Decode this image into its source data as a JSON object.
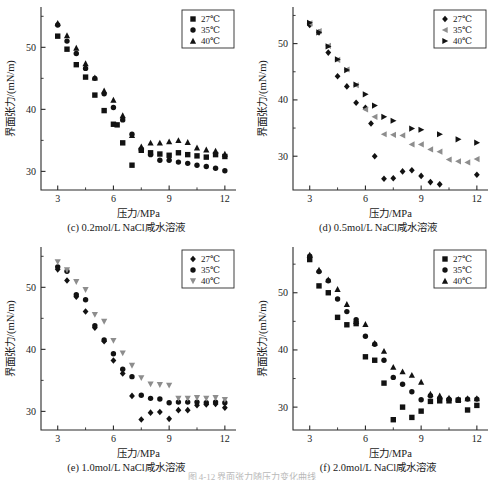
{
  "figure": {
    "caption_clipped": "图 4-12  界面张力随压力变化曲线",
    "panels_order": [
      "c",
      "d",
      "e",
      "f"
    ]
  },
  "axes": {
    "xlabel": "压力/MPa",
    "ylabel": "界面张力/(mN/m)",
    "xlim": [
      2.1,
      12.6
    ],
    "ylim": [
      27.0,
      56.5
    ],
    "xticks_major": [
      3,
      6,
      9,
      12
    ],
    "xticks_minor": [
      4.5,
      7.5,
      10.5
    ],
    "yticks_major": [
      30,
      40,
      50
    ],
    "yticks_minor": [
      35,
      45,
      55
    ],
    "xtick_labels": [
      "3",
      "6",
      "9",
      "12"
    ],
    "ytick_labels": [
      "30",
      "40",
      "50"
    ],
    "grid": false,
    "legend_position": "top-right"
  },
  "legend_labels": {
    "t27": "27℃",
    "t35": "35℃",
    "t40": "40℃"
  },
  "colors": {
    "ink": "#1a1a1a",
    "axis": "#2b2b2b",
    "marker_dark": "#121212",
    "marker_gray": "#8d8d8d",
    "caption_faint": "#b9b9b9"
  },
  "chart_data": [
    {
      "id": "c",
      "type": "scatter",
      "title": "(c)  0.2mol/L NaCl咸水溶液",
      "xlabel": "压力/MPa",
      "ylabel": "界面张力/(mN/m)",
      "xlim": [
        2.1,
        12.6
      ],
      "ylim": [
        27.0,
        56.5
      ],
      "grid": false,
      "series": [
        {
          "name": "27℃",
          "marker": "square",
          "color": "#121212",
          "x": [
            3.0,
            3.5,
            4.0,
            4.5,
            5.0,
            5.5,
            6.0,
            6.2,
            6.5,
            7.0,
            7.5,
            8.0,
            8.5,
            9.0,
            9.5,
            10.0,
            10.5,
            11.0,
            11.5,
            12.0
          ],
          "y": [
            51.8,
            49.7,
            47.2,
            45.2,
            42.3,
            39.8,
            37.6,
            37.5,
            34.6,
            31.0,
            33.4,
            33.0,
            32.8,
            32.6,
            33.0,
            32.7,
            32.5,
            32.3,
            32.7,
            32.4
          ]
        },
        {
          "name": "35℃",
          "marker": "circle",
          "color": "#121212",
          "x": [
            3.0,
            3.5,
            4.0,
            4.5,
            5.0,
            5.5,
            6.0,
            6.5,
            7.0,
            7.5,
            8.0,
            8.5,
            9.0,
            9.5,
            10.0,
            10.5,
            11.0,
            11.5,
            12.0
          ],
          "y": [
            53.6,
            51.0,
            49.0,
            46.6,
            45.0,
            42.5,
            40.3,
            38.3,
            36.0,
            33.5,
            32.7,
            31.8,
            31.8,
            31.5,
            31.3,
            31.0,
            30.8,
            30.5,
            30.1
          ]
        },
        {
          "name": "40℃",
          "marker": "triangle-up",
          "color": "#121212",
          "x": [
            3.0,
            3.5,
            4.0,
            4.5,
            5.0,
            5.5,
            6.0,
            6.5,
            7.0,
            7.5,
            8.0,
            8.5,
            9.0,
            9.5,
            10.0,
            10.5,
            11.0,
            11.5,
            12.0
          ],
          "y": [
            53.9,
            51.9,
            49.9,
            47.4,
            45.1,
            43.0,
            41.5,
            39.0,
            35.8,
            34.0,
            34.6,
            34.6,
            34.8,
            35.0,
            34.7,
            33.8,
            33.5,
            33.3,
            32.8
          ]
        }
      ]
    },
    {
      "id": "d",
      "type": "scatter",
      "title": "(d)  0.5mol/L NaCl咸水溶液",
      "xlabel": "压力/MPa",
      "ylabel": "界面张力/(mN/m)",
      "xlim": [
        2.1,
        12.6
      ],
      "ylim": [
        24.0,
        56.5
      ],
      "grid": false,
      "series": [
        {
          "name": "27℃",
          "marker": "diamond",
          "color": "#121212",
          "x": [
            3.0,
            3.5,
            4.0,
            4.5,
            5.0,
            5.5,
            6.0,
            6.3,
            6.5,
            7.0,
            7.5,
            8.0,
            8.5,
            9.0,
            9.5,
            10.0,
            12.0
          ],
          "y": [
            53.3,
            52.0,
            48.4,
            44.2,
            42.4,
            39.5,
            38.6,
            35.8,
            30.0,
            26.0,
            26.1,
            27.3,
            27.5,
            26.5,
            25.4,
            25.0,
            26.7
          ]
        },
        {
          "name": "35℃",
          "marker": "triangle-left",
          "color": "#8d8d8d",
          "x": [
            3.0,
            3.5,
            4.0,
            4.5,
            5.0,
            5.5,
            6.0,
            6.5,
            7.0,
            7.5,
            8.0,
            8.5,
            9.0,
            9.5,
            10.0,
            10.5,
            11.0,
            11.5,
            12.0
          ],
          "y": [
            53.6,
            52.2,
            49.6,
            47.1,
            45.4,
            42.6,
            38.3,
            37.0,
            33.9,
            33.8,
            33.7,
            32.1,
            32.1,
            31.2,
            30.8,
            29.4,
            29.1,
            28.9,
            29.5
          ]
        },
        {
          "name": "40℃",
          "marker": "triangle-right",
          "color": "#121212",
          "x": [
            3.0,
            3.5,
            4.0,
            4.5,
            5.0,
            5.5,
            6.0,
            6.5,
            7.0,
            7.5,
            8.5,
            9.0,
            10.0,
            11.0,
            12.0
          ],
          "y": [
            53.7,
            52.0,
            49.5,
            47.2,
            45.3,
            42.7,
            41.0,
            39.0,
            37.0,
            36.3,
            34.9,
            34.7,
            33.9,
            33.0,
            32.4
          ]
        }
      ]
    },
    {
      "id": "e",
      "type": "scatter",
      "title": "(e)  1.0mol/L NaCl咸水溶液",
      "xlabel": "压力/MPa",
      "ylabel": "界面张力/(mN/m)",
      "xlim": [
        2.1,
        12.6
      ],
      "ylim": [
        27.0,
        56.5
      ],
      "grid": false,
      "series": [
        {
          "name": "27℃",
          "marker": "diamond",
          "color": "#121212",
          "x": [
            3.0,
            3.5,
            4.0,
            4.5,
            5.0,
            5.5,
            6.0,
            6.5,
            7.0,
            7.5,
            8.0,
            8.5,
            9.0,
            9.5,
            10.0,
            10.5,
            11.0,
            11.5,
            12.0
          ],
          "y": [
            52.9,
            51.1,
            48.5,
            46.1,
            43.5,
            41.3,
            38.2,
            36.1,
            32.5,
            28.7,
            29.8,
            29.9,
            28.8,
            30.2,
            30.2,
            31.0,
            31.1,
            31.2,
            30.6
          ]
        },
        {
          "name": "35℃",
          "marker": "circle",
          "color": "#121212",
          "x": [
            3.0,
            3.5,
            4.0,
            4.5,
            5.0,
            5.5,
            6.0,
            6.5,
            7.0,
            7.5,
            8.0,
            8.5,
            9.0,
            9.5,
            10.0,
            10.5,
            11.0,
            11.5,
            12.0
          ],
          "y": [
            53.3,
            52.6,
            48.8,
            48.0,
            43.8,
            41.5,
            39.3,
            36.8,
            35.6,
            32.6,
            32.1,
            32.0,
            31.4,
            31.5,
            31.5,
            31.5,
            31.4,
            31.5,
            31.4
          ]
        },
        {
          "name": "40℃",
          "marker": "triangle-down",
          "color": "#8d8d8d",
          "x": [
            3.0,
            3.5,
            4.0,
            4.5,
            5.0,
            5.5,
            6.0,
            6.5,
            7.0,
            7.5,
            8.0,
            8.5,
            9.0,
            9.5,
            10.0,
            10.5,
            11.0,
            11.5,
            12.0
          ],
          "y": [
            54.1,
            52.8,
            50.9,
            49.6,
            45.6,
            44.5,
            41.4,
            39.4,
            37.4,
            35.4,
            34.4,
            34.3,
            34.2,
            32.1,
            32.1,
            32.2,
            32.1,
            32.2,
            31.9
          ]
        }
      ]
    },
    {
      "id": "f",
      "type": "scatter",
      "title": "(f)  2.0mol/L NaCl咸水溶液",
      "xlabel": "压力/MPa",
      "ylabel": "界面张力/(mN/m)",
      "xlim": [
        2.1,
        12.6
      ],
      "ylim": [
        26.0,
        58.0
      ],
      "grid": false,
      "series": [
        {
          "name": "27℃",
          "marker": "square",
          "color": "#121212",
          "x": [
            3.0,
            3.5,
            4.0,
            4.5,
            5.0,
            5.5,
            6.0,
            6.5,
            7.0,
            7.5,
            8.0,
            8.5,
            9.0,
            9.5,
            10.0,
            10.5,
            11.0,
            11.5,
            12.0
          ],
          "y": [
            55.8,
            51.2,
            50.0,
            45.7,
            44.4,
            44.6,
            38.8,
            38.2,
            34.2,
            27.8,
            30.0,
            28.2,
            29.3,
            31.0,
            31.1,
            31.1,
            31.2,
            29.5,
            30.3
          ]
        },
        {
          "name": "35℃",
          "marker": "circle",
          "color": "#121212",
          "x": [
            3.0,
            3.5,
            4.0,
            4.5,
            5.0,
            5.5,
            6.0,
            6.5,
            7.0,
            7.5,
            8.0,
            8.5,
            9.0,
            9.5,
            10.0,
            10.5,
            11.0,
            11.5,
            12.0
          ],
          "y": [
            56.4,
            53.7,
            52.1,
            48.9,
            46.7,
            45.3,
            42.4,
            41.0,
            38.2,
            35.2,
            34.0,
            32.7,
            31.3,
            32.0,
            31.5,
            31.4,
            31.3,
            31.4,
            31.4
          ]
        },
        {
          "name": "40℃",
          "marker": "triangle-up",
          "color": "#121212",
          "x": [
            3.0,
            3.5,
            4.0,
            4.5,
            5.0,
            5.5,
            6.0,
            6.5,
            7.0,
            7.5,
            8.0,
            8.5,
            9.0,
            9.5,
            10.0,
            10.5,
            11.0,
            11.5,
            12.0
          ],
          "y": [
            56.6,
            54.0,
            52.3,
            50.6,
            48.0,
            45.0,
            44.5,
            41.2,
            39.8,
            37.0,
            36.2,
            35.6,
            34.4,
            32.3,
            32.0,
            31.6,
            31.4,
            31.5,
            31.5
          ]
        }
      ]
    }
  ]
}
